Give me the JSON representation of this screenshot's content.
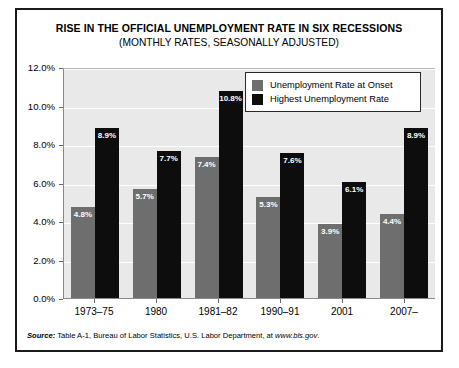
{
  "chart_data": {
    "type": "bar",
    "title": "RISE IN THE OFFICIAL UNEMPLOYMENT RATE IN SIX RECESSIONS",
    "subtitle": "(MONTHLY RATES, SEASONALLY ADJUSTED)",
    "xlabel": "",
    "ylabel": "",
    "ylim": [
      0,
      12
    ],
    "grid": true,
    "legend_position": "top-right",
    "categories": [
      "1973–75",
      "1980",
      "1981–82",
      "1990–91",
      "2001",
      "2007–"
    ],
    "ytick_labels": [
      "12.0%",
      "10.0%",
      "8.0%",
      "6.0%",
      "4.0%",
      "2.0%",
      "0.0%"
    ],
    "ytick_values": [
      12,
      10,
      8,
      6,
      4,
      2,
      0
    ],
    "series": [
      {
        "name": "Unemployment Rate at Onset",
        "color": "#6e6e6e",
        "values": [
          4.8,
          5.7,
          7.4,
          5.3,
          3.9,
          4.4
        ],
        "labels": [
          "4.8%",
          "5.7%",
          "7.4%",
          "5.3%",
          "3.9%",
          "4.4%"
        ]
      },
      {
        "name": "Highest Unemployment Rate",
        "color": "#0d0d0d",
        "values": [
          8.9,
          7.7,
          10.8,
          7.6,
          6.1,
          8.9
        ],
        "labels": [
          "8.9%",
          "7.7%",
          "10.8%",
          "7.6%",
          "6.1%",
          "8.9%"
        ]
      }
    ]
  },
  "legend": {
    "items": [
      {
        "label": "Unemployment Rate at Onset"
      },
      {
        "label": "Highest Unemployment Rate"
      }
    ]
  },
  "source": {
    "label": "Source:",
    "text": " Table A-1,  Bureau of Labor Statistics, U.S. Labor Department, at ",
    "url": "www.bls.gov",
    "period": "."
  }
}
